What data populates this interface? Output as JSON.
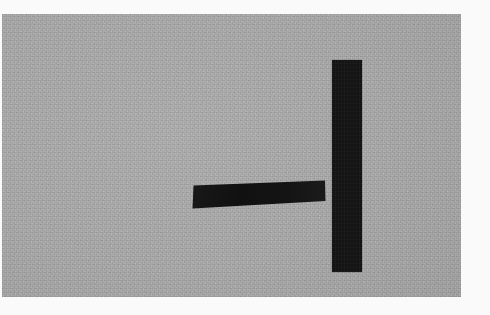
{
  "image": {
    "width": 490,
    "height": 315,
    "background_color": "#fafafa",
    "description": "Photographic scan of a plain gray surface bearing two solid black brush-like marks: a short tilted horizontal bar and a tall vertical bar, together resembling a minus sign beside an upright stroke.",
    "alt_text": "Black horizontal dash and vertical bar on grainy gray background"
  },
  "panel": {
    "name": "gray-background-panel",
    "fill_color": "#ababab",
    "texture": "film-grain",
    "x": 2,
    "y": 14,
    "width": 459,
    "height": 283
  },
  "marks": {
    "vertical": {
      "label": "vertical-stroke",
      "fill_color": "#141414",
      "x": 332,
      "y": 60,
      "width": 30,
      "height": 212,
      "orientation": "vertical"
    },
    "horizontal": {
      "label": "horizontal-stroke",
      "fill_color": "#141414",
      "x": 192,
      "y": 180,
      "width": 133,
      "height": 28,
      "orientation": "horizontal-tilted",
      "tilt": "rises slightly toward the right"
    }
  },
  "geometry": {
    "gap_between_marks_px": 7
  }
}
